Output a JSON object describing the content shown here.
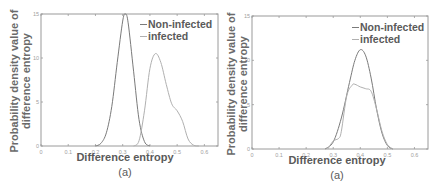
{
  "chart_data": [
    {
      "type": "line",
      "title": "",
      "caption": "(a)",
      "xlabel": "Difference entropy",
      "ylabel": "Probability density value of difference entropy",
      "xlim": [
        0,
        0.65
      ],
      "ylim": [
        0,
        15
      ],
      "xticks": [
        "0",
        "0.1",
        "0.2",
        "0.3",
        "0.4",
        "0.5",
        "0.6"
      ],
      "yticks": [
        "0",
        "5",
        "10",
        "15"
      ],
      "grid": false,
      "legend_position": "upper right",
      "series": [
        {
          "name": "Non-infected",
          "color": "#7a7a7a",
          "x": [
            0.2,
            0.22,
            0.24,
            0.26,
            0.28,
            0.3,
            0.31,
            0.32,
            0.34,
            0.36,
            0.38,
            0.4
          ],
          "y": [
            0,
            0.3,
            1.5,
            4.5,
            9.5,
            14.2,
            15.0,
            14.0,
            8.5,
            3.0,
            0.5,
            0
          ]
        },
        {
          "name": "infected",
          "color": "#b0b0b0",
          "x": [
            0.34,
            0.36,
            0.38,
            0.4,
            0.42,
            0.44,
            0.46,
            0.48,
            0.5,
            0.52,
            0.54,
            0.56,
            0.58
          ],
          "y": [
            0,
            0.6,
            4.0,
            8.8,
            10.5,
            9.5,
            7.0,
            4.8,
            4.0,
            2.8,
            0.8,
            0.1,
            0
          ]
        }
      ]
    },
    {
      "type": "line",
      "title": "",
      "caption": "(a)",
      "xlabel": "Difference entropy",
      "ylabel": "Probability density value of difference entropy",
      "xlim": [
        0,
        0.65
      ],
      "ylim": [
        0,
        15
      ],
      "xticks": [
        "0",
        "0.1",
        "0.2",
        "0.3",
        "0.4",
        "0.5",
        "0.6"
      ],
      "yticks": [
        "0",
        "5",
        "10",
        "15"
      ],
      "grid": false,
      "legend_position": "upper right",
      "series": [
        {
          "name": "Non-infected",
          "color": "#7a7a7a",
          "x": [
            0.27,
            0.3,
            0.33,
            0.36,
            0.38,
            0.4,
            0.42,
            0.44,
            0.46,
            0.48,
            0.5,
            0.52
          ],
          "y": [
            0,
            0.8,
            3.5,
            7.5,
            10.0,
            11.2,
            10.5,
            8.0,
            4.5,
            1.8,
            0.4,
            0
          ]
        },
        {
          "name": "infected",
          "color": "#b0b0b0",
          "x": [
            0.28,
            0.3,
            0.32,
            0.33,
            0.35,
            0.37,
            0.38,
            0.4,
            0.42,
            0.44,
            0.46,
            0.48,
            0.5,
            0.52
          ],
          "y": [
            0,
            0.9,
            1.2,
            2.0,
            6.0,
            7.2,
            7.3,
            7.0,
            6.8,
            6.5,
            4.5,
            2.0,
            0.5,
            0
          ]
        }
      ]
    }
  ],
  "panels": [
    {
      "ylabel_line1": "Probability density value of",
      "ylabel_line2": "difference entropy",
      "xlabel": "Difference entropy",
      "caption": "(a)",
      "legend": [
        "Non-infected",
        "infected"
      ]
    },
    {
      "ylabel_line1": "Probability density value of",
      "ylabel_line2": "difference entropy",
      "xlabel": "Difference entropy",
      "caption": "(a)",
      "legend": [
        "Non-infected",
        "infected"
      ]
    }
  ],
  "colors": {
    "axis": "#9a9a9a",
    "tick_text": "#a0a0a0",
    "label_text": "#5a5a5a",
    "non_infected": "#7a7a7a",
    "infected": "#b0b0b0"
  }
}
